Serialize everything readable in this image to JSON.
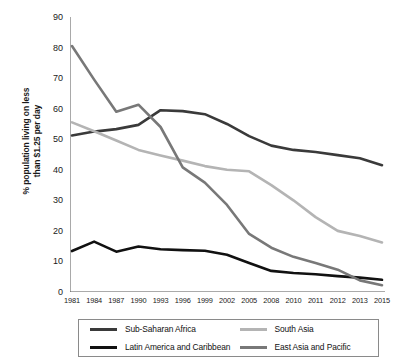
{
  "chart_data": {
    "type": "line",
    "title": "",
    "xlabel": "",
    "ylabel": "% population living on less\nthan $1.25 per day",
    "ylim": [
      0,
      90
    ],
    "ytick_step": 10,
    "grid": false,
    "legend_position": "bottom",
    "categories": [
      "1981",
      "1984",
      "1987",
      "1990",
      "1993",
      "1996",
      "1999",
      "2002",
      "2005",
      "2008",
      "2010",
      "2011",
      "2012",
      "2013",
      "2015"
    ],
    "yticks": [
      "0",
      "10",
      "20",
      "30",
      "40",
      "50",
      "60",
      "70",
      "80",
      "90"
    ],
    "series": [
      {
        "name": "Sub-Saharan Africa",
        "color": "#3a3a3a",
        "values": [
          51.2,
          52.5,
          53.3,
          54.7,
          59.5,
          59.2,
          58.2,
          55.0,
          51.0,
          47.9,
          46.5,
          45.8,
          44.8,
          43.8,
          41.5
        ]
      },
      {
        "name": "Latin America and Caribbean",
        "color": "#111111",
        "values": [
          13.4,
          16.5,
          13.2,
          14.9,
          14.0,
          13.7,
          13.5,
          12.2,
          9.5,
          6.9,
          6.2,
          5.8,
          5.2,
          4.7,
          4.0
        ]
      },
      {
        "name": "South Asia",
        "color": "#b4b4b4",
        "values": [
          55.5,
          52.6,
          49.6,
          46.5,
          44.7,
          43.0,
          41.2,
          40.0,
          39.5,
          35.0,
          30.0,
          24.5,
          20.0,
          18.3,
          16.2
        ]
      },
      {
        "name": "East Asia and Pacific",
        "color": "#787878",
        "values": [
          80.5,
          69.5,
          59.0,
          61.3,
          54.0,
          40.8,
          35.8,
          28.5,
          19.0,
          14.5,
          11.5,
          9.5,
          7.3,
          3.8,
          2.2
        ]
      }
    ]
  },
  "legend": {
    "entries": [
      {
        "label": "Sub-Saharan Africa",
        "color": "#3a3a3a"
      },
      {
        "label": "South Asia",
        "color": "#b4b4b4"
      },
      {
        "label": "Latin America and Caribbean",
        "color": "#111111"
      },
      {
        "label": "East Asia and Pacific",
        "color": "#787878"
      }
    ]
  },
  "axis": {
    "color": "#555555"
  }
}
